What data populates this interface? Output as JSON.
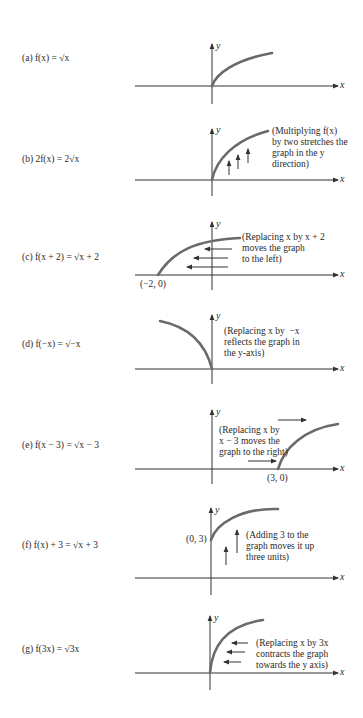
{
  "panels": [
    {
      "id": "a",
      "label": "(a)  f(x)  =  √x",
      "note": ""
    },
    {
      "id": "b",
      "label": "(b)  2f(x)  =  2√x",
      "note": "(Multiplying f(x)\nby two stretches the\ngraph in the y\ndirection)"
    },
    {
      "id": "c",
      "label": "(c)  f(x + 2)  =  √x + 2",
      "note": "(Replacing x by x + 2\nmoves the graph\nto the left)",
      "point": "(−2, 0)"
    },
    {
      "id": "d",
      "label": "(d)  f(−x)  =  √−x",
      "note": "(Replacing x by  −x\nreflects the graph in\nthe y-axis)"
    },
    {
      "id": "e",
      "label": "(e)  f(x − 3)  =  √x − 3",
      "note": "(Replacing x by\nx − 3 moves the\ngraph to the right)",
      "point": "(3, 0)"
    },
    {
      "id": "f",
      "label": "(f)  f(x) + 3  =  √x + 3",
      "note": "(Adding 3 to the\ngraph moves it up\nthree units)",
      "point": "(0, 3)"
    },
    {
      "id": "g",
      "label": "(g)  f(3x)  =  √3x",
      "note": "(Replacing x by 3x\ncontracts the graph\ntowards the y axis)"
    }
  ],
  "axes": {
    "x_label": "x",
    "y_label": "y"
  },
  "colors": {
    "curve": "#6a6a6a",
    "axis": "#333333",
    "text": "#2a2a2a"
  }
}
